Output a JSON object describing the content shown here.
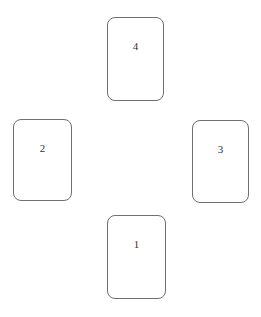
{
  "diagram": {
    "type": "card-spread",
    "cards": [
      {
        "position": 1,
        "label": "1",
        "placement": "bottom"
      },
      {
        "position": 2,
        "label": "2",
        "placement": "left"
      },
      {
        "position": 3,
        "label": "3",
        "placement": "right"
      },
      {
        "position": 4,
        "label": "4",
        "placement": "top"
      }
    ]
  },
  "colors": {
    "border": "#6f6f6f",
    "text": "#333333",
    "background": "#ffffff"
  }
}
